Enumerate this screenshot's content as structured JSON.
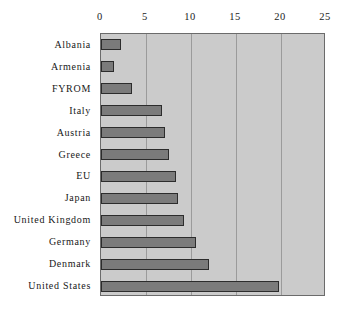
{
  "chart_data": {
    "type": "bar",
    "orientation": "horizontal",
    "title": "",
    "subtitle": "",
    "xlabel": "",
    "ylabel": "",
    "xlim": [
      0,
      25
    ],
    "ylim": null,
    "grid": true,
    "grid_axis": "x",
    "legend": null,
    "legend_position": "none",
    "xticks": [
      0,
      5,
      10,
      15,
      20,
      25
    ],
    "xtick_labels": [
      "0",
      "5",
      "10",
      "15",
      "20",
      "25"
    ],
    "categories": [
      "Albania",
      "Armenia",
      "FYROM",
      "Italy",
      "Austria",
      "Greece",
      "EU",
      "Japan",
      "United Kingdom",
      "Germany",
      "Denmark",
      "United States"
    ],
    "values": [
      2.2,
      1.4,
      3.4,
      6.8,
      7.1,
      7.5,
      8.3,
      8.6,
      9.2,
      10.5,
      12.0,
      19.8
    ],
    "series": [
      {
        "name": "value",
        "values": [
          2.2,
          1.4,
          3.4,
          6.8,
          7.1,
          7.5,
          8.3,
          8.6,
          9.2,
          10.5,
          12.0,
          19.8
        ]
      }
    ],
    "annotations": []
  },
  "style": {
    "plot_background": "#cbcbcb",
    "page_background": "#ffffff",
    "bar_fill": "#7b7b7b",
    "bar_border": "#2c2c2c",
    "gridline_color": "#9b9b9b",
    "axis_border": "#6b6b6b",
    "text_color": "#181818"
  }
}
